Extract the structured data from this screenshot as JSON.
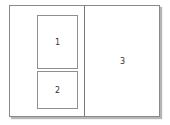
{
  "diagram": {
    "regions": [
      {
        "id": 1,
        "label": "1"
      },
      {
        "id": 2,
        "label": "2"
      },
      {
        "id": 3,
        "label": "3"
      }
    ]
  }
}
